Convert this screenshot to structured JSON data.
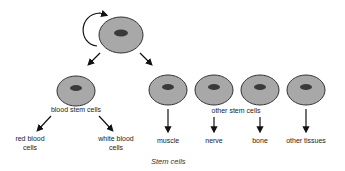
{
  "diagram": {
    "title": "Stem cells",
    "colors": {
      "cell_fill": "#a8a8a8",
      "cell_stroke": "#333333",
      "nucleus": "#3a3a3a",
      "arrow": "#111111"
    },
    "root": {
      "label": "",
      "self_renewal_arrow": true
    },
    "level1": {
      "blood_stem_cells": "blood stem cells",
      "other_stem_cells": "other stem cells"
    },
    "blood_outputs": [
      {
        "line1": "red blood",
        "line2": "cells"
      },
      {
        "line1": "white blood",
        "line2": "cells"
      }
    ],
    "other_outputs": [
      "muscle",
      "nerve",
      "bone",
      "other tissues"
    ]
  }
}
